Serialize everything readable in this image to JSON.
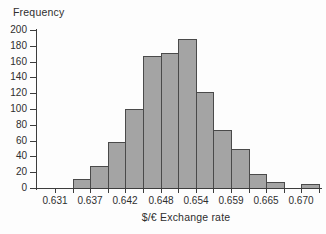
{
  "chart_data": {
    "type": "bar",
    "subtype": "histogram",
    "title": "",
    "ylabel": "Frequency",
    "xlabel": "$/€ Exchange rate",
    "ylim": [
      0,
      200
    ],
    "y_ticks": [
      0,
      20,
      40,
      60,
      80,
      100,
      120,
      140,
      160,
      180,
      200
    ],
    "n_bins": 15,
    "bin_values": [
      0,
      12,
      28,
      58,
      100,
      167,
      171,
      188,
      122,
      74,
      49,
      18,
      8,
      0,
      5
    ],
    "total_count": 1000,
    "x_tick_labels": [
      "0.631",
      "0.637",
      "0.642",
      "0.648",
      "0.654",
      "0.659",
      "0.665",
      "0.670"
    ],
    "x_labeled_tick_indices": [
      0,
      2,
      4,
      6,
      8,
      10,
      12,
      14
    ],
    "approx_bin_width": 0.0028,
    "grid": false,
    "legend": null,
    "colors": {
      "bar_fill": "#a4a4a4",
      "bar_border": "#4a4a4a",
      "axis": "#3d3d3d",
      "text": "#2e2e2e",
      "background": "#fdfdfd"
    }
  }
}
